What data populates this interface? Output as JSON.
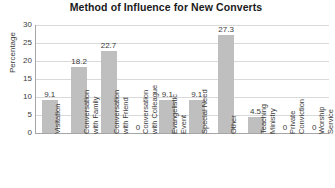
{
  "chart_data": {
    "type": "bar",
    "title": "Method of Influence for New Converts",
    "xlabel": "",
    "ylabel": "Percentage",
    "ylim": [
      0,
      30
    ],
    "yticks": [
      0,
      5,
      10,
      15,
      20,
      25,
      30
    ],
    "grid": true,
    "legend": false,
    "bar_color": "#bfbfbf",
    "categories": [
      "Visitation",
      "Conversation with Family",
      "Conversation with Friend",
      "Conversation with Colleague",
      "Evangelistic Event",
      "Special Need",
      "Other",
      "Teaching Ministry",
      "Private Conviction",
      "Worship Service"
    ],
    "category_lines": [
      "Visitation",
      "Conversation\nwith Family",
      "Conversation\nwith Friend",
      "Conversation\nwith Colleague",
      "Evangelistic\nEvent",
      "Special Need",
      "Other",
      "Teaching\nMinistry",
      "Private\nConviction",
      "Worship\nService"
    ],
    "values": [
      9.1,
      18.2,
      22.7,
      0,
      9.1,
      9.1,
      27.3,
      4.5,
      0,
      0
    ],
    "value_labels": [
      "9.1",
      "18.2",
      "22.7",
      "0",
      "9.1",
      "9.1",
      "27.3",
      "4.5",
      "0",
      "0"
    ]
  }
}
